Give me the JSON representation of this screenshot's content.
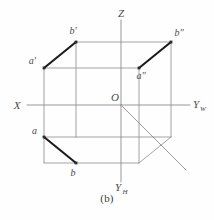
{
  "figure": {
    "caption": "(b)",
    "title_kind": "three-view projection box with line AB"
  },
  "axes": {
    "x_label": "X",
    "z_label": "Z",
    "yw_label": "Y",
    "yw_sub": "W",
    "yh_label": "Y",
    "yh_sub": "H",
    "origin_label": "O"
  },
  "points": {
    "a_front": "a'",
    "b_front": "b'",
    "a_profile": "a\"",
    "b_profile": "b\"",
    "a_top": "a",
    "b_top": "b"
  },
  "colors": {
    "line_light": "#9a9a9a",
    "line_axis": "#8c8c8c",
    "line_bold": "#1c1c1c",
    "label": "#4a4a4a",
    "background": "#fefefe"
  },
  "geometry": {
    "box": {
      "front_top_left": [
        44,
        68
      ],
      "front_top_right": [
        139,
        68
      ],
      "front_bottom_left": [
        44,
        163
      ],
      "front_bottom_right": [
        139,
        163
      ],
      "back_top_left": [
        76,
        42
      ],
      "back_top_right": [
        171,
        42
      ],
      "back_bottom_right": [
        171,
        137
      ]
    },
    "projections": [
      {
        "name": "frontal",
        "from": "a'",
        "to": "b'",
        "p1": [
          44,
          68
        ],
        "p2": [
          76,
          42
        ]
      },
      {
        "name": "profile",
        "from": "a\"",
        "to": "b\"",
        "p1": [
          139,
          68
        ],
        "p2": [
          171,
          42
        ]
      },
      {
        "name": "horizontal",
        "from": "a",
        "to": "b",
        "p1": [
          44,
          137
        ],
        "p2": [
          76,
          163
        ]
      }
    ],
    "origin": [
      121,
      105
    ],
    "diagonal_end": [
      186,
      170
    ]
  }
}
